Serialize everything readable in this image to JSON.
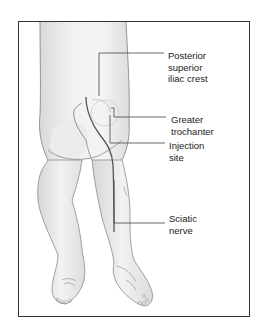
{
  "figure": {
    "labels": [
      {
        "id": "posterior-superior-iliac-crest",
        "text": "Posterior\nsuperior\niliac crest"
      },
      {
        "id": "greater-trochanter",
        "text": "Greater\ntrochanter"
      },
      {
        "id": "injection-site",
        "text": "Injection\nsite"
      },
      {
        "id": "sciatic-nerve",
        "text": "Sciatic\nnerve"
      }
    ],
    "colors": {
      "frame": "#333333",
      "skin_fill": "#eeeeee",
      "skin_shade": "#d8d8d8",
      "outline": "#777777",
      "leader_line": "#444444",
      "nerve": "#555555",
      "text": "#222222"
    }
  }
}
